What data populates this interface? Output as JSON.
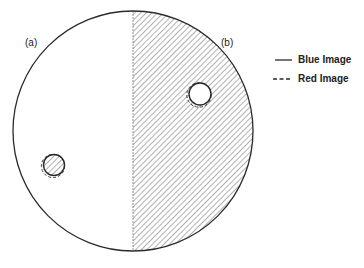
{
  "diagram": {
    "labels": {
      "left_half": "(a)",
      "right_half": "(b)"
    },
    "legend": [
      {
        "style": "solid",
        "label": "Blue Image"
      },
      {
        "style": "dashed",
        "label": "Red Image"
      }
    ],
    "colors": {
      "line": "#2a2a2a",
      "hatch": "#555555",
      "background": "#ffffff"
    }
  }
}
